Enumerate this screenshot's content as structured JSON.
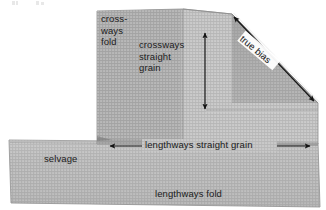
{
  "labels": {
    "crossways_fold": "cross-\nways\nfold",
    "crossways_straight_grain": "crossways\nstraight\ngrain",
    "lengthways_straight_grain": "lengthways straight grain",
    "lengthways_fold": "lengthways fold",
    "selvage": "selvage",
    "true_bias": "true bias"
  },
  "arrows": [
    {
      "name": "crossways-grain-arrow",
      "orientation": "vertical",
      "heads": "double",
      "x1": 205,
      "y1": 30,
      "x2": 205,
      "y2": 112
    },
    {
      "name": "lengthways-grain-arrow",
      "orientation": "horizontal",
      "heads": "double",
      "x1": 107,
      "y1": 146,
      "x2": 313,
      "y2": 146
    },
    {
      "name": "true-bias-arrow",
      "orientation": "diagonal",
      "heads": "double",
      "x1": 232,
      "y1": 15,
      "x2": 316,
      "y2": 103
    }
  ],
  "colors": {
    "fabric_light": "#c2c2c2",
    "fabric_mid": "#b4b4b4",
    "fabric_dark": "#a6a6a6",
    "fabric_shadow": "#999999",
    "weave_line": "#a0a0a0",
    "edge_line": "#8c8c8c",
    "ink": "#1b1b1b",
    "background": "#ffffff"
  },
  "shapes": {
    "upper_panel": "M 97,11 L 183,9 L 232,14 L 318,103 L 318,145 L 97,145 Z",
    "lower_band": "M 9,140 L 318,143 L 320,207 L 11,203 Z",
    "bias_triangle": "M 232,14 L 318,103 L 232,103 Z",
    "fold_seam_vertical_x": 183,
    "fold_seam_lower_y": 118
  }
}
